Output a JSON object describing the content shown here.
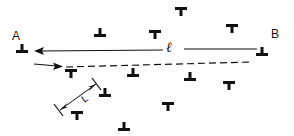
{
  "diagram": {
    "labels": {
      "point_a": "A",
      "point_b": "B",
      "line_length": "ℓ",
      "spacing": "L"
    },
    "colors": {
      "ink": "#111111",
      "background": "#ffffff"
    },
    "line_AB": {
      "style": "solid",
      "from": [
        257,
        50
      ],
      "to": [
        36,
        51
      ],
      "arrowhead": "left",
      "gap_for_label": [
        163,
        184
      ]
    },
    "short_arrow": {
      "style": "solid",
      "from": [
        34,
        64
      ],
      "to": [
        62,
        67
      ],
      "arrowhead": "right"
    },
    "dashed_line": {
      "style": "dashed",
      "from": [
        66,
        67
      ],
      "to": [
        252,
        62
      ]
    },
    "spacing_indicator": {
      "from": [
        59,
        111
      ],
      "to": [
        97,
        83
      ],
      "arrowheads": "both",
      "label": "L"
    },
    "dislocations": [
      {
        "id": "A",
        "x": 22,
        "y": 47,
        "orientation": "inverted"
      },
      {
        "id": "B",
        "x": 262,
        "y": 50,
        "orientation": "inverted"
      },
      {
        "x": 100,
        "y": 31,
        "orientation": "inverted"
      },
      {
        "x": 181,
        "y": 13,
        "orientation": "upright"
      },
      {
        "x": 155,
        "y": 36,
        "orientation": "upright"
      },
      {
        "x": 232,
        "y": 30,
        "orientation": "upright"
      },
      {
        "x": 71,
        "y": 75,
        "orientation": "upright"
      },
      {
        "x": 133,
        "y": 71,
        "orientation": "inverted"
      },
      {
        "x": 190,
        "y": 75,
        "orientation": "inverted"
      },
      {
        "x": 105,
        "y": 91,
        "orientation": "inverted"
      },
      {
        "x": 229,
        "y": 87,
        "orientation": "upright"
      },
      {
        "x": 77,
        "y": 117,
        "orientation": "upright"
      },
      {
        "x": 124,
        "y": 125,
        "orientation": "inverted"
      },
      {
        "x": 168,
        "y": 108,
        "orientation": "upright"
      }
    ]
  }
}
